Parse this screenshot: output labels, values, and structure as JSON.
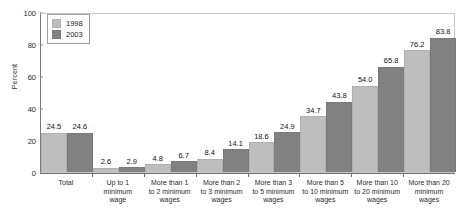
{
  "chart_data": {
    "type": "bar",
    "title": "",
    "xlabel": "",
    "ylabel": "Percent",
    "ylim": [
      0,
      100
    ],
    "yticks": [
      0,
      20,
      40,
      60,
      80,
      100
    ],
    "grid": false,
    "legend_position": "top-left",
    "categories": [
      "Total",
      "Up to 1 minimum wage",
      "More than 1 to 2 minimum wages",
      "More than 2 to 3 minimum wages",
      "More than 3 to 5 minimum wages",
      "More than 5 to 10 minimum wages",
      "More than 10 to 20 minimum wages",
      "More than 20 minimum wages"
    ],
    "category_lines": [
      [
        "Total"
      ],
      [
        "Up to 1",
        "minimum",
        "wage"
      ],
      [
        "More than 1",
        "to 2 minimum",
        "wages"
      ],
      [
        "More than 2",
        "to 3 minimum",
        "wages"
      ],
      [
        "More than 3",
        "to 5 minimum",
        "wages"
      ],
      [
        "More than 5",
        "to 10 minimum",
        "wages"
      ],
      [
        "More than 10",
        "to 20 minimum",
        "wages"
      ],
      [
        "More than 20",
        "minimum",
        "wages"
      ]
    ],
    "series": [
      {
        "name": "1998",
        "color": "#bebebe",
        "values": [
          24.5,
          2.6,
          4.8,
          8.4,
          18.6,
          34.7,
          54.0,
          76.2
        ],
        "labels": [
          "24.5",
          "2.6",
          "4.8",
          "8.4",
          "18.6",
          "34.7",
          "54.0",
          "76.2"
        ]
      },
      {
        "name": "2003",
        "color": "#818181",
        "values": [
          24.6,
          2.9,
          6.7,
          14.1,
          24.9,
          43.8,
          65.8,
          83.8
        ],
        "labels": [
          "24.6",
          "2.9",
          "6.7",
          "14.1",
          "24.9",
          "43.8",
          "65.8",
          "83.8"
        ]
      }
    ]
  },
  "legend": {
    "items": [
      {
        "label": "1998"
      },
      {
        "label": "2003"
      }
    ]
  },
  "axis": {
    "y_title": "Percent",
    "y_tick_labels": [
      "0",
      "20",
      "40",
      "60",
      "80",
      "100"
    ]
  },
  "colors": {
    "series_1998": "#bebebe",
    "series_2003": "#818181",
    "axis": "#6e6e6e",
    "frame": "#c9c9c9",
    "background": "#ffffff"
  }
}
